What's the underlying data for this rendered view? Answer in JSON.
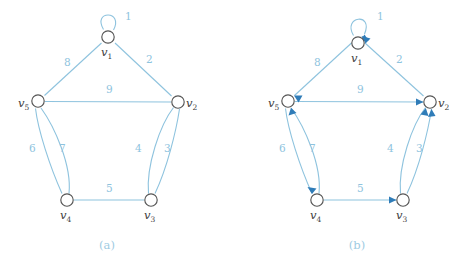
{
  "figure": {
    "kind": "graph-diagram-pair",
    "colors": {
      "edge": "#8ec3de",
      "arrowhead": "#2f7cb8",
      "node_stroke": "#555555",
      "node_fill": "#ffffff",
      "vertex_label": "#3b3b3b",
      "edge_label": "#8ec3de",
      "caption": "#9ecbe2",
      "background": "#ffffff"
    },
    "panels": [
      {
        "id": "a",
        "caption": "(a)",
        "directed": false,
        "vertices": [
          {
            "id": "v1",
            "label": "v",
            "sub": "1",
            "x": 108,
            "y": 37,
            "label_x": 101,
            "label_y": 56
          },
          {
            "id": "v2",
            "label": "v",
            "sub": "2",
            "x": 178,
            "y": 102,
            "label_x": 186,
            "label_y": 107
          },
          {
            "id": "v3",
            "label": "v",
            "sub": "3",
            "x": 151,
            "y": 200,
            "label_x": 144,
            "label_y": 219
          },
          {
            "id": "v4",
            "label": "v",
            "sub": "4",
            "x": 67,
            "y": 200,
            "label_x": 60,
            "label_y": 219
          },
          {
            "id": "v5",
            "label": "v",
            "sub": "5",
            "x": 38,
            "y": 101,
            "label_x": 18,
            "label_y": 107
          }
        ],
        "edges": [
          {
            "id": "e1",
            "label": "1",
            "from": "v1",
            "to": "v1",
            "kind": "loop",
            "label_x": 125,
            "label_y": 20
          },
          {
            "id": "e2",
            "label": "2",
            "from": "v1",
            "to": "v2",
            "kind": "straight",
            "label_x": 146,
            "label_y": 63
          },
          {
            "id": "e8",
            "label": "8",
            "from": "v1",
            "to": "v5",
            "kind": "straight",
            "label_x": 64,
            "label_y": 66
          },
          {
            "id": "e9",
            "label": "9",
            "from": "v2",
            "to": "v5",
            "kind": "straight",
            "label_x": 106,
            "label_y": 93
          },
          {
            "id": "e3",
            "label": "3",
            "from": "v3",
            "to": "v2",
            "kind": "curve-right",
            "label_x": 164,
            "label_y": 152
          },
          {
            "id": "e4",
            "label": "4",
            "from": "v3",
            "to": "v2",
            "kind": "curve-left",
            "label_x": 135,
            "label_y": 152
          },
          {
            "id": "e5",
            "label": "5",
            "from": "v4",
            "to": "v3",
            "kind": "straight",
            "label_x": 106,
            "label_y": 192
          },
          {
            "id": "e6",
            "label": "6",
            "from": "v4",
            "to": "v5",
            "kind": "curve-left",
            "label_x": 29,
            "label_y": 152
          },
          {
            "id": "e7",
            "label": "7",
            "from": "v4",
            "to": "v5",
            "kind": "curve-right",
            "label_x": 59,
            "label_y": 152
          }
        ]
      },
      {
        "id": "b",
        "caption": "(b)",
        "directed": true,
        "vertices": [
          {
            "id": "v1",
            "label": "v",
            "sub": "1",
            "x": 358,
            "y": 43,
            "label_x": 351,
            "label_y": 62
          },
          {
            "id": "v2",
            "label": "v",
            "sub": "2",
            "x": 430,
            "y": 102,
            "label_x": 438,
            "label_y": 107
          },
          {
            "id": "v3",
            "label": "v",
            "sub": "3",
            "x": 403,
            "y": 200,
            "label_x": 396,
            "label_y": 219
          },
          {
            "id": "v4",
            "label": "v",
            "sub": "4",
            "x": 317,
            "y": 200,
            "label_x": 310,
            "label_y": 219
          },
          {
            "id": "v5",
            "label": "v",
            "sub": "5",
            "x": 288,
            "y": 101,
            "label_x": 268,
            "label_y": 107
          }
        ],
        "edges": [
          {
            "id": "e1",
            "label": "1",
            "from": "v1",
            "to": "v1",
            "kind": "loop",
            "label_x": 377,
            "label_y": 20
          },
          {
            "id": "e2",
            "label": "2",
            "from": "v2",
            "to": "v1",
            "kind": "straight",
            "label_x": 396,
            "label_y": 63
          },
          {
            "id": "e8",
            "label": "8",
            "from": "v1",
            "to": "v5",
            "kind": "straight",
            "label_x": 314,
            "label_y": 66
          },
          {
            "id": "e9",
            "label": "9",
            "from": "v5",
            "to": "v2",
            "kind": "straight",
            "label_x": 357,
            "label_y": 93
          },
          {
            "id": "e3",
            "label": "3",
            "from": "v3",
            "to": "v2",
            "kind": "curve-right",
            "label_x": 416,
            "label_y": 152
          },
          {
            "id": "e4",
            "label": "4",
            "from": "v3",
            "to": "v2",
            "kind": "curve-left",
            "label_x": 387,
            "label_y": 152
          },
          {
            "id": "e5",
            "label": "5",
            "from": "v4",
            "to": "v3",
            "kind": "straight",
            "label_x": 357,
            "label_y": 192
          },
          {
            "id": "e6",
            "label": "6",
            "from": "v5",
            "to": "v4",
            "kind": "curve-left",
            "label_x": 279,
            "label_y": 152
          },
          {
            "id": "e7",
            "label": "7",
            "from": "v4",
            "to": "v5",
            "kind": "curve-right",
            "label_x": 309,
            "label_y": 152
          }
        ]
      }
    ],
    "captions": [
      {
        "id": "caption-a",
        "text": "(a)",
        "x": 107,
        "y": 249
      },
      {
        "id": "caption-b",
        "text": "(b)",
        "x": 357,
        "y": 249
      }
    ]
  }
}
